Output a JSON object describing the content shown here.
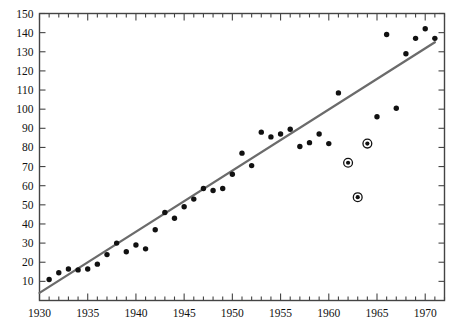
{
  "chart_data": {
    "type": "scatter",
    "title": "",
    "subtitle": "",
    "xlabel": "",
    "ylabel": "",
    "xlim": [
      1930,
      1972
    ],
    "ylim": [
      0,
      150
    ],
    "xticks": [
      1930,
      1935,
      1940,
      1945,
      1950,
      1955,
      1960,
      1965,
      1970
    ],
    "xtick_labels": [
      "1930",
      "1935",
      "1940",
      "1945",
      "1950",
      "1955",
      "1960",
      "1965",
      "1970"
    ],
    "x_minor_tick_step": 1,
    "yticks": [
      10,
      20,
      30,
      40,
      50,
      60,
      70,
      80,
      90,
      100,
      110,
      120,
      130,
      140,
      150
    ],
    "ytick_labels": [
      "10",
      "20",
      "30",
      "40",
      "50",
      "60",
      "70",
      "80",
      "90",
      "100",
      "110",
      "120",
      "130",
      "140",
      "150"
    ],
    "grid": false,
    "legend": null,
    "legend_position": "none",
    "frame": "box",
    "tick_direction": "in",
    "marker_color": "#111111",
    "trend_color": "#6b6b6b",
    "series": [
      {
        "name": "observations",
        "marker": "filled-circle",
        "x": [
          1931,
          1932,
          1933,
          1934,
          1935,
          1936,
          1937,
          1938,
          1939,
          1940,
          1941,
          1942,
          1943,
          1944,
          1945,
          1946,
          1947,
          1948,
          1949,
          1950,
          1951,
          1952,
          1953,
          1954,
          1955,
          1956,
          1957,
          1958,
          1959,
          1960,
          1961,
          1965,
          1966,
          1967,
          1968,
          1969,
          1970,
          1971
        ],
        "y": [
          11,
          14.5,
          16.5,
          16,
          16.5,
          19,
          24,
          30,
          25.5,
          29,
          27,
          37,
          46,
          43,
          49,
          53,
          58.5,
          57.5,
          58.5,
          66,
          77,
          70.5,
          88,
          85.5,
          87,
          89.5,
          80.5,
          82.5,
          87,
          82,
          108.5,
          96,
          139,
          100.5,
          129,
          137,
          142,
          137
        ]
      },
      {
        "name": "highlighted-outliers",
        "marker": "circled-dot",
        "x": [
          1962,
          1963,
          1964
        ],
        "y": [
          72,
          54,
          82
        ]
      }
    ],
    "trend": {
      "type": "linear-fit",
      "x_start": 1930,
      "y_start": 4,
      "x_end": 1971,
      "y_end": 135
    }
  }
}
